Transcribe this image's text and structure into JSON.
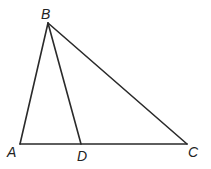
{
  "diagram": {
    "type": "triangle",
    "points": {
      "A": {
        "label": "A",
        "x": 20,
        "y": 144
      },
      "B": {
        "label": "B",
        "x": 48,
        "y": 23
      },
      "C": {
        "label": "C",
        "x": 187,
        "y": 144
      },
      "D": {
        "label": "D",
        "x": 81,
        "y": 144
      }
    },
    "segments": [
      [
        "A",
        "B"
      ],
      [
        "B",
        "C"
      ],
      [
        "A",
        "C"
      ],
      [
        "B",
        "D"
      ]
    ],
    "stroke_color": "#2a2a2a"
  }
}
